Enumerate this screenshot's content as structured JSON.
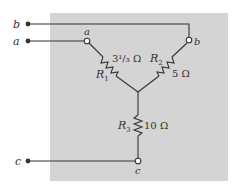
{
  "diagram": {
    "type": "wye-resistor-network",
    "panel_color": "#d4d4d4",
    "wire_color": "#333333",
    "external_terminals": [
      {
        "id": "b",
        "label": "b"
      },
      {
        "id": "a",
        "label": "a"
      },
      {
        "id": "c",
        "label": "c"
      }
    ],
    "node_labels": {
      "a": "a",
      "b": "b",
      "c": "c"
    },
    "resistors": [
      {
        "id": "R1",
        "name": "R",
        "sub": "1",
        "value": "3¹/₃ Ω"
      },
      {
        "id": "R2",
        "name": "R",
        "sub": "2",
        "value": "5 Ω"
      },
      {
        "id": "R3",
        "name": "R",
        "sub": "3",
        "value": "10 Ω"
      }
    ]
  }
}
